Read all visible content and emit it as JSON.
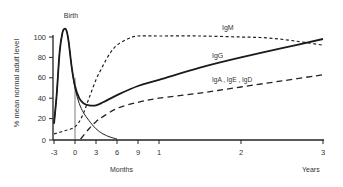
{
  "chart_data": {
    "type": "line",
    "title": "",
    "xlabel_months": "Months",
    "xlabel_years": "Years",
    "ylabel": "% mean normal adult level",
    "ylim": [
      0,
      110
    ],
    "yticks": [
      0,
      20,
      40,
      60,
      80,
      100
    ],
    "xticks": [
      {
        "label": "-3",
        "months": -3
      },
      {
        "label": "0",
        "months": 0
      },
      {
        "label": "3",
        "months": 3
      },
      {
        "label": "6",
        "months": 6
      },
      {
        "label": "9",
        "months": 9
      },
      {
        "label": "1",
        "months": 12
      },
      {
        "label": "2",
        "months": 24
      },
      {
        "label": "3",
        "months": 36
      }
    ],
    "annotations": [
      {
        "text": "Birth",
        "months": -1.3,
        "value": 112
      }
    ],
    "grid": false,
    "legend": "inline labels",
    "series": [
      {
        "name": "Maternal IgG",
        "style": "solid-thin",
        "x_months": [
          -3,
          -2.6,
          -2.2,
          -1.8,
          -1.5,
          -1.2,
          -0.9,
          -0.5,
          0,
          0.6,
          1.2,
          2,
          3,
          4,
          5,
          6
        ],
        "values": [
          15,
          45,
          85,
          104,
          108,
          106,
          95,
          72,
          50,
          35,
          26,
          18,
          10,
          5,
          2,
          0
        ]
      },
      {
        "name": "IgG",
        "label": "IgG",
        "style": "solid-thick",
        "x_months": [
          -3,
          -2.6,
          -2.2,
          -1.8,
          -1.5,
          -1.2,
          -0.9,
          -0.5,
          0,
          0.6,
          1.2,
          2,
          3,
          4,
          6,
          9,
          12,
          18,
          24,
          30,
          36
        ],
        "values": [
          15,
          45,
          85,
          104,
          108,
          106,
          95,
          72,
          52,
          40,
          35,
          33,
          33,
          36,
          43,
          52,
          58,
          70,
          80,
          89,
          98
        ]
      },
      {
        "name": "IgM",
        "label": "IgM",
        "style": "short-dash",
        "x_months": [
          -3,
          -1.5,
          0,
          1,
          2,
          3,
          4,
          5,
          6,
          7.5,
          9,
          12,
          18,
          24,
          28,
          32,
          36
        ],
        "values": [
          5,
          8,
          12,
          22,
          40,
          58,
          72,
          84,
          92,
          98,
          101,
          101,
          101,
          100,
          99,
          96,
          92
        ]
      },
      {
        "name": "IgA, IgE, IgD",
        "label": "IgA , IgE , IgD",
        "style": "long-dash",
        "x_months": [
          0.8,
          2,
          3,
          4,
          6,
          9,
          12,
          18,
          24,
          30,
          36
        ],
        "values": [
          0,
          10,
          17,
          22,
          30,
          36,
          40,
          45,
          51,
          57,
          63
        ]
      }
    ]
  },
  "labels": {
    "birth": "Birth",
    "igm": "IgM",
    "igg": "IgG",
    "iga": "IgA , IgE , IgD",
    "months": "Months",
    "years": "Years",
    "ylabel": "% mean normal adult level"
  }
}
